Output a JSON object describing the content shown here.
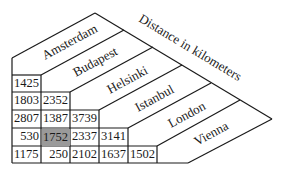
{
  "title": "Distance in kilometers",
  "cities": [
    "Amsterdam",
    "Budapest",
    "Helsinki",
    "Istanbul",
    "London",
    "Vienna"
  ],
  "highlight": {
    "row": 3,
    "col": 1,
    "value": "1752",
    "color": "#9a9a9a"
  },
  "rows": [
    {
      "city": "Budapest",
      "values": [
        "1425"
      ]
    },
    {
      "city": "Helsinki",
      "values": [
        "1803",
        "2352"
      ]
    },
    {
      "city": "Istanbul",
      "values": [
        "2807",
        "1387",
        "3739"
      ]
    },
    {
      "city": "London",
      "values": [
        "530",
        "1752",
        "2337",
        "3141"
      ]
    },
    {
      "city": "Vienna",
      "values": [
        "1175",
        "250",
        "2102",
        "1637",
        "1502"
      ]
    }
  ],
  "cells": {
    "r0c0": "1425",
    "r1c0": "1803",
    "r1c1": "2352",
    "r2c0": "2807",
    "r2c1": "1387",
    "r2c2": "3739",
    "r3c0": "530",
    "r3c1": "1752",
    "r3c2": "2337",
    "r3c3": "3141",
    "r4c0": "1175",
    "r4c1": "250",
    "r4c2": "2102",
    "r4c3": "1637",
    "r4c4": "1502"
  }
}
